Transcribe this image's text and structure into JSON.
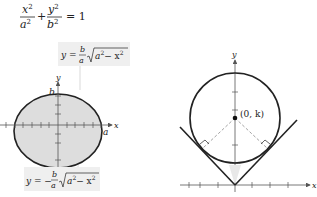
{
  "equation": {
    "x_term_num": "x",
    "x_term_den": "a",
    "plus": "+",
    "y_term_num": "y",
    "y_term_den": "b",
    "equals": "= 1",
    "exp": "2"
  },
  "left_figure": {
    "upper_label": {
      "lhs": "y =",
      "num": "b",
      "den": "a",
      "radicand": "a",
      "minus": "− x",
      "exp": "2"
    },
    "lower_label": {
      "lhs": "y = −",
      "num": "b",
      "den": "a",
      "radicand": "a",
      "minus": "− x",
      "exp": "2"
    },
    "x_axis_label": "x",
    "y_axis_label": "y",
    "b_label": "b",
    "a_label": "a",
    "colors": {
      "fill": "#dddddd",
      "stroke": "#222222",
      "label_bg": "#efefef"
    }
  },
  "right_figure": {
    "x_axis_label": "x",
    "y_axis_label": "y",
    "center_label": "(0, k)",
    "colors": {
      "stroke": "#222222",
      "dashed": "#999999"
    }
  }
}
